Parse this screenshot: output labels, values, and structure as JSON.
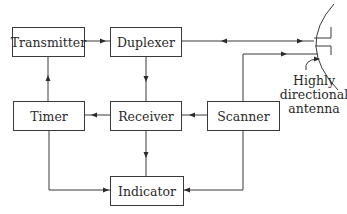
{
  "diagram": {
    "type": "block-diagram",
    "blocks": [
      {
        "id": "transmitter",
        "label": "Transmitter",
        "x": 12,
        "y": 27,
        "w": 72,
        "h": 29
      },
      {
        "id": "duplexer",
        "label": "Duplexer",
        "x": 110,
        "y": 27,
        "w": 71,
        "h": 29
      },
      {
        "id": "timer",
        "label": "Timer",
        "x": 13,
        "y": 101,
        "w": 71,
        "h": 29
      },
      {
        "id": "receiver",
        "label": "Receiver",
        "x": 110,
        "y": 101,
        "w": 71,
        "h": 29
      },
      {
        "id": "scanner",
        "label": "Scanner",
        "x": 207,
        "y": 101,
        "w": 72,
        "h": 29
      },
      {
        "id": "indicator",
        "label": "Indicator",
        "x": 110,
        "y": 176,
        "w": 73,
        "h": 29
      }
    ],
    "connections": [
      {
        "from": "transmitter",
        "to": "duplexer",
        "direction": "right"
      },
      {
        "from": "timer",
        "to": "transmitter",
        "direction": "up"
      },
      {
        "from": "duplexer",
        "to": "receiver",
        "direction": "down"
      },
      {
        "from": "receiver",
        "to": "timer",
        "direction": "left"
      },
      {
        "from": "scanner",
        "to": "receiver",
        "direction": "left"
      },
      {
        "from": "receiver",
        "to": "indicator",
        "direction": "down"
      },
      {
        "from": "timer",
        "to": "indicator",
        "direction": "down-then-right"
      },
      {
        "from": "scanner",
        "to": "indicator",
        "direction": "down-then-left"
      },
      {
        "from": "duplexer",
        "to": "antenna",
        "direction": "bidirectional"
      },
      {
        "from": "scanner",
        "to": "antenna",
        "direction": "up-then-right"
      }
    ],
    "antenna": {
      "label_lines": [
        "Highly",
        "directional",
        "antenna"
      ]
    }
  }
}
